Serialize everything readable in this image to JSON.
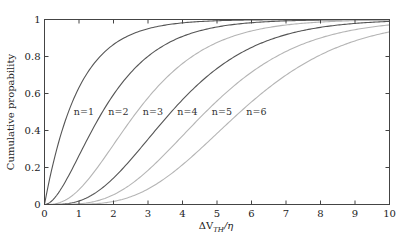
{
  "chart_data": {
    "type": "line",
    "title": "",
    "xlabel": "ΔV_TH/η",
    "ylabel": "Cumulative propability",
    "xlim": [
      0,
      10
    ],
    "ylim": [
      0,
      1
    ],
    "xticks": [
      0,
      1,
      2,
      3,
      4,
      5,
      6,
      7,
      8,
      9,
      10
    ],
    "yticks": [
      0,
      0.2,
      0.4,
      0.6,
      0.8,
      1
    ],
    "ytick_labels": [
      "0",
      "0.2",
      "0.4",
      "0.6",
      "0.8",
      "1"
    ],
    "grid": false,
    "legend": "inline labels",
    "x": [
      0,
      1,
      2,
      3,
      4,
      5,
      6,
      7,
      8,
      9,
      10
    ],
    "series": [
      {
        "name": "n=1",
        "n": 1,
        "color": "#555555",
        "label_pos": [
          1.2,
          0.5
        ],
        "values": [
          0,
          0.632,
          0.865,
          0.95,
          0.982,
          0.993,
          0.998,
          0.999,
          1.0,
          1.0,
          1.0
        ]
      },
      {
        "name": "n=2",
        "n": 2,
        "color": "#555555",
        "label_pos": [
          2.2,
          0.5
        ],
        "values": [
          0,
          0.264,
          0.594,
          0.801,
          0.908,
          0.96,
          0.983,
          0.993,
          0.997,
          0.999,
          1.0
        ]
      },
      {
        "name": "n=3",
        "n": 3,
        "color": "#b5b5b5",
        "label_pos": [
          3.2,
          0.5
        ],
        "values": [
          0,
          0.08,
          0.323,
          0.577,
          0.762,
          0.875,
          0.938,
          0.97,
          0.986,
          0.994,
          0.997
        ]
      },
      {
        "name": "n=4",
        "n": 4,
        "color": "#555555",
        "label_pos": [
          4.2,
          0.5
        ],
        "values": [
          0,
          0.019,
          0.143,
          0.353,
          0.567,
          0.735,
          0.849,
          0.918,
          0.958,
          0.979,
          0.99
        ]
      },
      {
        "name": "n=5",
        "n": 5,
        "color": "#b5b5b5",
        "label_pos": [
          5.2,
          0.5
        ],
        "values": [
          0,
          0.004,
          0.053,
          0.185,
          0.371,
          0.56,
          0.715,
          0.827,
          0.9,
          0.945,
          0.971
        ]
      },
      {
        "name": "n=6",
        "n": 6,
        "color": "#b5b5b5",
        "label_pos": [
          6.2,
          0.5
        ],
        "values": [
          0,
          0.001,
          0.017,
          0.084,
          0.215,
          0.384,
          0.554,
          0.699,
          0.809,
          0.884,
          0.933
        ]
      }
    ]
  }
}
